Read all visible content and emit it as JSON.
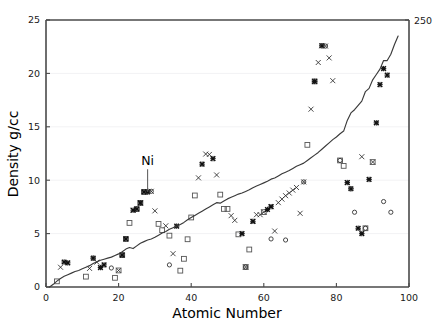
{
  "chart_data": {
    "type": "scatter",
    "title": "",
    "xlabel": "Atomic Number",
    "ylabel": "Density g/cc",
    "xlim": [
      0,
      100
    ],
    "ylim": [
      0,
      25
    ],
    "xticks": [
      0,
      20,
      40,
      60,
      80,
      100
    ],
    "yticks": [
      0,
      5,
      10,
      15,
      20,
      25
    ],
    "xtick_labels": [
      "0",
      "20",
      "40",
      "60",
      "80",
      "100"
    ],
    "ytick_labels": [
      "0",
      "5",
      "10",
      "15",
      "20",
      "25"
    ],
    "grid": "horizontal-faint",
    "legend": "none",
    "right_axis": {
      "label_top": "250",
      "ticks_shown": [
        "250"
      ]
    },
    "annotations": [
      {
        "text": "Ni",
        "x": 28,
        "y": 11.4,
        "leader_to_x": 28,
        "leader_to_y": 8.9
      }
    ],
    "series": [
      {
        "name": "cumulative-line",
        "marker": "none",
        "style": "line",
        "color": "#3a3a3a",
        "points": [
          [
            1,
            0.0
          ],
          [
            2,
            0.25
          ],
          [
            3,
            0.55
          ],
          [
            4,
            0.8
          ],
          [
            5,
            1.0
          ],
          [
            6,
            1.15
          ],
          [
            7,
            1.3
          ],
          [
            8,
            1.45
          ],
          [
            9,
            1.55
          ],
          [
            10,
            1.7
          ],
          [
            11,
            1.85
          ],
          [
            12,
            2.0
          ],
          [
            13,
            2.2
          ],
          [
            14,
            2.35
          ],
          [
            15,
            2.5
          ],
          [
            16,
            2.6
          ],
          [
            17,
            2.7
          ],
          [
            18,
            2.8
          ],
          [
            19,
            2.95
          ],
          [
            20,
            3.1
          ],
          [
            21,
            3.3
          ],
          [
            22,
            3.55
          ],
          [
            23,
            3.7
          ],
          [
            24,
            3.6
          ],
          [
            25,
            3.85
          ],
          [
            26,
            4.1
          ],
          [
            27,
            4.25
          ],
          [
            28,
            4.4
          ],
          [
            29,
            4.5
          ],
          [
            30,
            4.65
          ],
          [
            31,
            4.85
          ],
          [
            32,
            5.05
          ],
          [
            33,
            5.2
          ],
          [
            34,
            5.4
          ],
          [
            35,
            5.55
          ],
          [
            36,
            5.7
          ],
          [
            37,
            5.85
          ],
          [
            38,
            6.05
          ],
          [
            39,
            6.3
          ],
          [
            40,
            6.5
          ],
          [
            41,
            6.7
          ],
          [
            42,
            6.9
          ],
          [
            43,
            7.1
          ],
          [
            44,
            7.3
          ],
          [
            45,
            7.5
          ],
          [
            46,
            7.7
          ],
          [
            47,
            7.9
          ],
          [
            48,
            7.85
          ],
          [
            49,
            8.05
          ],
          [
            50,
            8.25
          ],
          [
            51,
            8.4
          ],
          [
            52,
            8.55
          ],
          [
            53,
            8.7
          ],
          [
            54,
            8.8
          ],
          [
            55,
            8.95
          ],
          [
            56,
            9.1
          ],
          [
            57,
            9.3
          ],
          [
            58,
            9.45
          ],
          [
            59,
            9.6
          ],
          [
            60,
            9.75
          ],
          [
            61,
            9.9
          ],
          [
            62,
            10.1
          ],
          [
            63,
            10.2
          ],
          [
            64,
            10.4
          ],
          [
            65,
            10.6
          ],
          [
            66,
            10.75
          ],
          [
            67,
            10.9
          ],
          [
            68,
            11.1
          ],
          [
            69,
            11.3
          ],
          [
            70,
            11.45
          ],
          [
            71,
            11.6
          ],
          [
            72,
            11.85
          ],
          [
            73,
            12.1
          ],
          [
            74,
            12.35
          ],
          [
            75,
            12.6
          ],
          [
            76,
            12.9
          ],
          [
            77,
            13.2
          ],
          [
            78,
            13.5
          ],
          [
            79,
            13.8
          ],
          [
            80,
            14.05
          ],
          [
            81,
            14.35
          ],
          [
            82,
            14.6
          ],
          [
            83,
            15.6
          ],
          [
            84,
            16.3
          ],
          [
            85,
            16.6
          ],
          [
            86,
            17.0
          ],
          [
            87,
            17.4
          ],
          [
            88,
            18.3
          ],
          [
            89,
            18.6
          ],
          [
            90,
            19.4
          ],
          [
            91,
            19.9
          ],
          [
            92,
            20.4
          ],
          [
            93,
            21.2
          ],
          [
            94,
            21.2
          ],
          [
            95,
            21.8
          ],
          [
            96,
            22.7
          ],
          [
            97,
            23.5
          ]
        ]
      },
      {
        "name": "x-markers",
        "marker": "x",
        "color": "#2b2b2b",
        "points": [
          [
            4,
            1.85
          ],
          [
            12,
            1.74
          ],
          [
            14,
            2.33
          ],
          [
            20,
            1.55
          ],
          [
            24,
            7.19
          ],
          [
            26,
            7.87
          ],
          [
            29,
            8.96
          ],
          [
            30,
            7.13
          ],
          [
            33,
            5.73
          ],
          [
            35,
            3.12
          ],
          [
            42,
            10.22
          ],
          [
            44,
            12.45
          ],
          [
            45,
            12.41
          ],
          [
            47,
            10.49
          ],
          [
            51,
            6.68
          ],
          [
            52,
            6.24
          ],
          [
            55,
            1.87
          ],
          [
            57,
            6.15
          ],
          [
            58,
            6.77
          ],
          [
            59,
            6.77
          ],
          [
            60,
            7.01
          ],
          [
            62,
            7.52
          ],
          [
            63,
            5.24
          ],
          [
            64,
            7.9
          ],
          [
            65,
            8.23
          ],
          [
            66,
            8.55
          ],
          [
            67,
            8.8
          ],
          [
            68,
            9.07
          ],
          [
            69,
            9.32
          ],
          [
            70,
            6.9
          ],
          [
            71,
            9.84
          ],
          [
            73,
            16.65
          ],
          [
            75,
            21.02
          ],
          [
            76,
            22.59
          ],
          [
            77,
            22.56
          ],
          [
            78,
            21.45
          ],
          [
            79,
            19.32
          ],
          [
            83,
            9.78
          ],
          [
            87,
            12.2
          ],
          [
            90,
            11.7
          ]
        ]
      },
      {
        "name": "square-markers",
        "marker": "square",
        "color": "#555555",
        "points": [
          [
            3,
            0.53
          ],
          [
            11,
            0.97
          ],
          [
            19,
            0.86
          ],
          [
            20,
            1.55
          ],
          [
            21,
            2.99
          ],
          [
            22,
            4.5
          ],
          [
            23,
            6.0
          ],
          [
            25,
            7.3
          ],
          [
            26,
            7.87
          ],
          [
            27,
            8.9
          ],
          [
            31,
            5.91
          ],
          [
            32,
            5.32
          ],
          [
            34,
            4.81
          ],
          [
            37,
            1.53
          ],
          [
            38,
            2.64
          ],
          [
            39,
            4.47
          ],
          [
            40,
            6.51
          ],
          [
            41,
            8.57
          ],
          [
            48,
            8.65
          ],
          [
            49,
            7.31
          ],
          [
            50,
            7.31
          ],
          [
            53,
            4.93
          ],
          [
            55,
            1.87
          ],
          [
            56,
            3.51
          ],
          [
            60,
            7.01
          ],
          [
            72,
            13.31
          ],
          [
            74,
            19.25
          ],
          [
            81,
            11.85
          ],
          [
            82,
            11.34
          ],
          [
            88,
            5.5
          ],
          [
            90,
            11.7
          ]
        ]
      },
      {
        "name": "bold-markers",
        "marker": "asterisk",
        "color": "#111111",
        "points": [
          [
            5,
            2.34
          ],
          [
            6,
            2.26
          ],
          [
            13,
            2.7
          ],
          [
            15,
            1.82
          ],
          [
            16,
            2.07
          ],
          [
            21,
            2.99
          ],
          [
            22,
            4.5
          ],
          [
            24,
            7.19
          ],
          [
            25,
            7.3
          ],
          [
            26,
            7.87
          ],
          [
            27,
            8.9
          ],
          [
            28,
            8.9
          ],
          [
            36,
            5.7
          ],
          [
            43,
            11.5
          ],
          [
            46,
            12.02
          ],
          [
            54,
            5.0
          ],
          [
            57,
            6.15
          ],
          [
            61,
            7.26
          ],
          [
            62,
            7.52
          ],
          [
            74,
            19.25
          ],
          [
            76,
            22.59
          ],
          [
            83,
            9.78
          ],
          [
            84,
            9.2
          ],
          [
            86,
            5.5
          ],
          [
            87,
            5.0
          ],
          [
            89,
            10.07
          ],
          [
            91,
            15.37
          ],
          [
            92,
            18.95
          ],
          [
            93,
            20.45
          ],
          [
            94,
            19.84
          ]
        ]
      },
      {
        "name": "open-circle-markers",
        "marker": "circle",
        "color": "#333333",
        "points": [
          [
            13,
            2.7
          ],
          [
            18,
            1.78
          ],
          [
            28,
            8.9
          ],
          [
            29,
            8.96
          ],
          [
            34,
            2.07
          ],
          [
            55,
            1.87
          ],
          [
            62,
            4.5
          ],
          [
            66,
            4.4
          ],
          [
            71,
            9.84
          ],
          [
            76,
            22.59
          ],
          [
            77,
            22.56
          ],
          [
            81,
            11.85
          ],
          [
            84,
            9.2
          ],
          [
            85,
            7.0
          ],
          [
            88,
            5.5
          ],
          [
            93,
            8.0
          ],
          [
            95,
            7.0
          ]
        ]
      }
    ]
  },
  "axes": {
    "x_title": "Atomic Number",
    "y_title": "Density g/cc",
    "right_top_label": "250"
  }
}
